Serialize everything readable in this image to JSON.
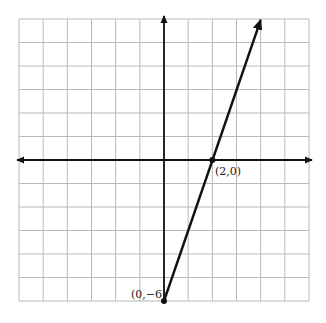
{
  "chart_data": {
    "type": "line",
    "title": "",
    "xlabel": "",
    "ylabel": "",
    "xlim": [
      -6,
      6
    ],
    "ylim": [
      -6,
      6
    ],
    "grid": true,
    "grid_step": 1,
    "axes_arrows": true,
    "series": [
      {
        "name": "line",
        "equation": "y = 3x - 6",
        "x": [
          0,
          4
        ],
        "y": [
          -6,
          6
        ],
        "color": "#111111",
        "arrow_end": true
      }
    ],
    "points": [
      {
        "x": 2,
        "y": 0,
        "label": "(2,0)"
      },
      {
        "x": 0,
        "y": -6,
        "label": "(0,−6)"
      }
    ]
  },
  "colors": {
    "grid": "#b8b8b8",
    "axis": "#111111",
    "line": "#111111",
    "background": "#ffffff"
  },
  "labels": {
    "x_intercept": "(2,0)",
    "y_intercept": "(0,−6)"
  }
}
